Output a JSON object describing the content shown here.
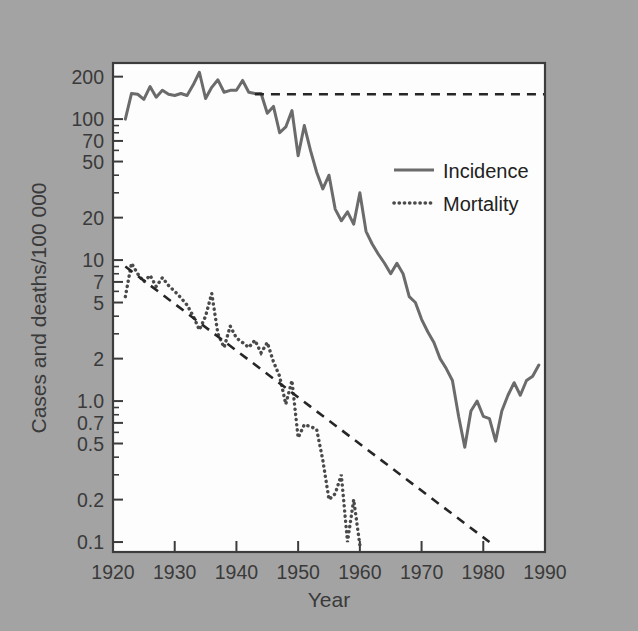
{
  "chart_data": {
    "type": "line",
    "title": "",
    "xlabel": "Year",
    "ylabel": "Cases and deaths/100 000",
    "yscale": "log",
    "xlim": [
      1920,
      1990
    ],
    "ylim": [
      0.085,
      250
    ],
    "grid": false,
    "legend_position": "upper right",
    "xticks": [
      1920,
      1930,
      1940,
      1950,
      1960,
      1970,
      1980,
      1990
    ],
    "xtick_labels": [
      "1920",
      "1930",
      "1940",
      "1950",
      "1960",
      "1970",
      "1980",
      "1990"
    ],
    "yticks": [
      200,
      100,
      70,
      50,
      20,
      10,
      7,
      5,
      2,
      1.0,
      0.7,
      0.5,
      0.2,
      0.1
    ],
    "ytick_labels": [
      "200",
      "100",
      "70",
      "50",
      "20",
      "10",
      "7",
      "5",
      "2",
      "1.0",
      "0.7",
      "0.5",
      "0.2",
      "0.1"
    ],
    "legend": [
      {
        "name": "Incidence",
        "style": "solid"
      },
      {
        "name": "Mortality",
        "style": "dotted"
      }
    ],
    "annotations": [
      {
        "name": "incidence-reference-line",
        "style": "dashed",
        "description": "Horizontal dashed line extending the pre-1943 incidence plateau across the chart",
        "x": [
          1943,
          1990
        ],
        "y": [
          150,
          150
        ]
      },
      {
        "name": "mortality-trend-line",
        "style": "dashed",
        "description": "Extrapolated declining mortality trend line",
        "x": [
          1922,
          1981
        ],
        "y": [
          9.0,
          0.1
        ]
      }
    ],
    "series": [
      {
        "name": "Incidence",
        "style": "solid",
        "color": "#6b6b6b",
        "x": [
          1922,
          1923,
          1924,
          1925,
          1926,
          1927,
          1928,
          1929,
          1930,
          1931,
          1932,
          1933,
          1934,
          1935,
          1936,
          1937,
          1938,
          1939,
          1940,
          1941,
          1942,
          1943,
          1944,
          1945,
          1946,
          1947,
          1948,
          1949,
          1950,
          1951,
          1952,
          1953,
          1954,
          1955,
          1956,
          1957,
          1958,
          1959,
          1960,
          1961,
          1962,
          1963,
          1964,
          1965,
          1966,
          1967,
          1968,
          1969,
          1970,
          1971,
          1972,
          1973,
          1974,
          1975,
          1976,
          1977,
          1978,
          1979,
          1980,
          1981,
          1982,
          1983,
          1984,
          1985,
          1986,
          1987,
          1988,
          1989
        ],
        "values": [
          100,
          152,
          150,
          138,
          170,
          143,
          160,
          150,
          147,
          152,
          147,
          175,
          215,
          140,
          168,
          190,
          155,
          160,
          160,
          188,
          155,
          152,
          152,
          110,
          123,
          80,
          88,
          115,
          55,
          90,
          60,
          42,
          32,
          40,
          23,
          19,
          22,
          18,
          30,
          16,
          13,
          11,
          9.5,
          8.0,
          9.5,
          8.0,
          5.5,
          5.0,
          3.8,
          3.1,
          2.6,
          2.0,
          1.7,
          1.4,
          0.78,
          0.47,
          0.85,
          1.0,
          0.78,
          0.75,
          0.52,
          0.85,
          1.1,
          1.35,
          1.1,
          1.4,
          1.5,
          1.8
        ]
      },
      {
        "name": "Mortality",
        "style": "dotted",
        "color": "#4a4a4a",
        "x": [
          1922,
          1923,
          1924,
          1925,
          1926,
          1927,
          1928,
          1929,
          1930,
          1931,
          1932,
          1933,
          1934,
          1935,
          1936,
          1937,
          1938,
          1939,
          1940,
          1941,
          1942,
          1943,
          1944,
          1945,
          1946,
          1947,
          1948,
          1949,
          1950,
          1951,
          1952,
          1953,
          1954,
          1955,
          1956,
          1957,
          1958,
          1959,
          1960
        ],
        "values": [
          5.5,
          9.5,
          8.0,
          7.0,
          7.8,
          6.5,
          7.5,
          6.6,
          6.0,
          5.4,
          4.8,
          4.0,
          3.2,
          4.0,
          5.8,
          3.0,
          2.4,
          3.4,
          2.8,
          2.6,
          2.4,
          2.7,
          2.2,
          2.6,
          1.9,
          1.5,
          0.95,
          1.4,
          0.55,
          0.68,
          0.66,
          0.63,
          0.38,
          0.2,
          0.22,
          0.3,
          0.1,
          0.2,
          0.095
        ]
      }
    ]
  },
  "legend": {
    "incidence_label": "Incidence",
    "mortality_label": "Mortality"
  },
  "axes": {
    "x_title": "Year",
    "y_title": "Cases and deaths/100 000"
  },
  "colors": {
    "background": "#a3a3a3",
    "plot_background": "#fdfdfd",
    "axis": "#3c3c3c",
    "incidence": "#6b6b6b",
    "mortality": "#4a4a4a",
    "trend": "#262626"
  }
}
